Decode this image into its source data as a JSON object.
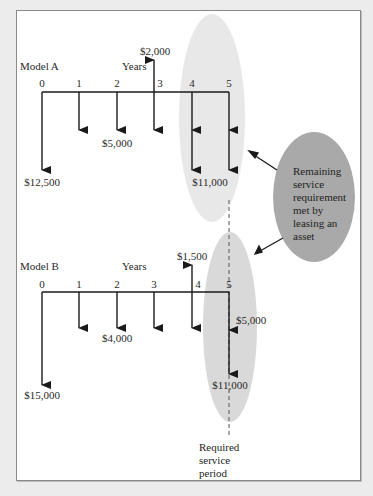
{
  "colors": {
    "background": "#ececec",
    "panel": "#ffffff",
    "panel_border": "#8a8a8a",
    "arrow": "#1a1a1a",
    "ellipse_light_a": "#e8e8e8",
    "ellipse_light_b": "#d9d9d9",
    "ellipse_callout": "#a9a9a9"
  },
  "model_a": {
    "label": "Model A",
    "axis_label": "Years",
    "years": [
      "0",
      "1",
      "2",
      "3",
      "4",
      "5"
    ],
    "cash_flows": [
      {
        "year": 0,
        "direction": "out",
        "label": "$12,500"
      },
      {
        "year": 1,
        "direction": "out",
        "label": ""
      },
      {
        "year": 2,
        "direction": "out",
        "label": "$5,000"
      },
      {
        "year": 3,
        "direction": "out",
        "label": ""
      },
      {
        "year": 3,
        "direction": "in",
        "label": "$2,000"
      },
      {
        "year": 4,
        "direction": "out",
        "label": "$5,000 + $11,000"
      },
      {
        "year": 5,
        "direction": "out",
        "label": "$5,000 + $11,000"
      }
    ],
    "labels": {
      "initial": "$12,500",
      "annual": "$5,000",
      "salvage": "$2,000",
      "overhaul": "$11,000"
    }
  },
  "model_b": {
    "label": "Model B",
    "axis_label": "Years",
    "years": [
      "0",
      "1",
      "2",
      "3",
      "4",
      "5"
    ],
    "cash_flows": [
      {
        "year": 0,
        "direction": "out",
        "label": "$15,000"
      },
      {
        "year": 1,
        "direction": "out",
        "label": ""
      },
      {
        "year": 2,
        "direction": "out",
        "label": "$4,000"
      },
      {
        "year": 3,
        "direction": "out",
        "label": ""
      },
      {
        "year": 4,
        "direction": "out",
        "label": ""
      },
      {
        "year": 4,
        "direction": "in",
        "label": "$1,500"
      },
      {
        "year": 5,
        "direction": "out",
        "label": "$5,000 + $11,000"
      }
    ],
    "labels": {
      "initial": "$15,000",
      "annual": "$4,000",
      "salvage": "$1,500",
      "lease": "$5,000",
      "overhaul": "$11,000"
    }
  },
  "callout": {
    "text": "Remaining\nservice\nrequirement\nmet by\nleasing an\nasset"
  },
  "service_period": {
    "text": "Required\nservice\nperiod"
  }
}
